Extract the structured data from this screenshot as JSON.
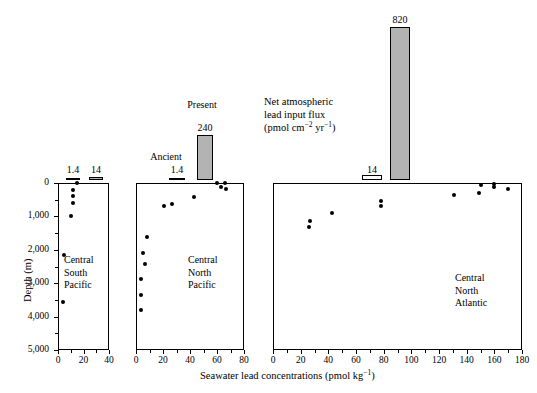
{
  "chart_data": {
    "type": "scatter",
    "title": "",
    "xlabel": "Seawater lead concentrations (pmol kg−1)",
    "ylabel": "Depth (m)",
    "ylim": [
      0,
      5000
    ],
    "y_ticks": [
      0,
      1000,
      2000,
      3000,
      4000,
      5000
    ],
    "y_tick_labels": [
      "0",
      "1,000",
      "2,000",
      "3,000",
      "4,000",
      "5,000"
    ],
    "y_minor_ticks": [
      500,
      1500,
      2500,
      3500,
      4500
    ],
    "grid": false,
    "legend": "none",
    "panels": [
      {
        "name": "Central South Pacific",
        "caption_lines": [
          "Central",
          "South",
          "Pacific"
        ],
        "xlim": [
          0,
          40
        ],
        "x_ticks": [
          0,
          20,
          40
        ],
        "x_tick_labels": [
          "0",
          "20",
          "40"
        ],
        "x_minor_ticks": [
          10,
          30
        ],
        "points": [
          {
            "x": 15,
            "y": 10
          },
          {
            "x": 12,
            "y": 220
          },
          {
            "x": 12,
            "y": 400
          },
          {
            "x": 12,
            "y": 600
          },
          {
            "x": 10,
            "y": 980
          },
          {
            "x": 4.5,
            "y": 2170
          },
          {
            "x": 4.0,
            "y": 3560
          }
        ],
        "flux_bars": [
          {
            "label": "1.4",
            "value": 1.4,
            "style": "line"
          },
          {
            "label": "14",
            "value": 14,
            "style": "gray"
          }
        ]
      },
      {
        "name": "Central North Pacific",
        "caption_lines": [
          "Central",
          "North",
          "Pacific"
        ],
        "xlim": [
          0,
          80
        ],
        "x_ticks": [
          0,
          20,
          40,
          60,
          80
        ],
        "x_tick_labels": [
          "0",
          "20",
          "40",
          "60",
          "80"
        ],
        "x_minor_ticks": [
          10,
          30,
          50,
          70
        ],
        "points": [
          {
            "x": 60,
            "y": 10
          },
          {
            "x": 66,
            "y": 5
          },
          {
            "x": 63,
            "y": 110
          },
          {
            "x": 67,
            "y": 190
          },
          {
            "x": 43,
            "y": 430
          },
          {
            "x": 27,
            "y": 620
          },
          {
            "x": 21,
            "y": 700
          },
          {
            "x": 8,
            "y": 1620
          },
          {
            "x": 5,
            "y": 2090
          },
          {
            "x": 7,
            "y": 2430
          },
          {
            "x": 4,
            "y": 2880
          },
          {
            "x": 4,
            "y": 3360
          },
          {
            "x": 4,
            "y": 3810
          }
        ],
        "flux_bars": [
          {
            "label": "1.4",
            "value": 1.4,
            "style": "line",
            "name": "Ancient"
          },
          {
            "label": "240",
            "value": 240,
            "style": "gray",
            "name": "Present"
          }
        ]
      },
      {
        "name": "Central North Atlantic",
        "caption_lines": [
          "Central",
          "North",
          "Atlantic"
        ],
        "xlim": [
          0,
          180
        ],
        "x_ticks": [
          0,
          20,
          40,
          60,
          80,
          100,
          120,
          140,
          160,
          180
        ],
        "x_tick_labels": [
          "0",
          "20",
          "40",
          "60",
          "80",
          "100",
          "120",
          "140",
          "160",
          "180"
        ],
        "x_minor_ticks": [
          10,
          30,
          50,
          70,
          90,
          110,
          130,
          150,
          170
        ],
        "points": [
          {
            "x": 150,
            "y": 60
          },
          {
            "x": 160,
            "y": 40
          },
          {
            "x": 160,
            "y": 110
          },
          {
            "x": 170,
            "y": 190
          },
          {
            "x": 149,
            "y": 310
          },
          {
            "x": 131,
            "y": 370
          },
          {
            "x": 78,
            "y": 530
          },
          {
            "x": 78,
            "y": 700
          },
          {
            "x": 43,
            "y": 900
          },
          {
            "x": 27,
            "y": 1140
          },
          {
            "x": 26,
            "y": 1320
          }
        ],
        "flux_bars": [
          {
            "label": "14",
            "value": 14,
            "style": "white"
          },
          {
            "label": "820",
            "value": 820,
            "style": "gray"
          }
        ]
      }
    ],
    "flux_legend": {
      "lines": [
        "Net atmospheric",
        "lead input flux",
        "(pmol cm−2 yr−1)"
      ],
      "line1": "Net atmospheric",
      "line2": "lead input flux",
      "line3_prefix": "(pmol cm",
      "line3_sup1": "−2",
      "line3_mid": " yr",
      "line3_sup2": "−1",
      "line3_suffix": ")"
    },
    "annotations": {
      "ancient": "Ancient",
      "present": "Present"
    },
    "colors": {
      "bar_gray": "#b3b3b3",
      "bar_white": "#ffffff",
      "axis": "#000000",
      "point": "#000000"
    }
  },
  "axis_text": {
    "x_title_prefix": "Seawater lead concentrations (pmol kg",
    "x_title_sup": "−1",
    "x_title_suffix": ")",
    "y_title": "Depth (m)"
  }
}
